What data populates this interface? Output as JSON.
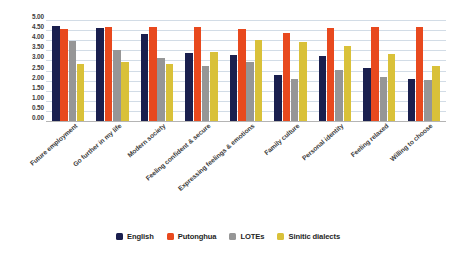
{
  "chart_data": {
    "type": "bar",
    "title": "",
    "subtitle": "",
    "xlabel": "",
    "ylabel": "",
    "ylim": [
      0,
      5
    ],
    "ytick_step": 0.5,
    "ytick_labels": [
      "0.00",
      "0.50",
      "1.00",
      "1.50",
      "2.00",
      "2.50",
      "3.00",
      "3.50",
      "4.00",
      "4.50",
      "5.00"
    ],
    "grid": true,
    "legend_position": "bottom",
    "categories": [
      "Future employment",
      "Go further in my life",
      "Modern society",
      "Feeling confident & secure",
      "Expressing feelings & emotions",
      "Family culture",
      "Personal identity",
      "Feeling relaxed",
      "Willing to choose"
    ],
    "series": [
      {
        "name": "English",
        "color": "#1a1f4e",
        "values": [
          4.7,
          4.62,
          4.32,
          3.35,
          3.28,
          2.28,
          3.23,
          2.62,
          2.08
        ]
      },
      {
        "name": "Putonghua",
        "color": "#e8491e",
        "values": [
          4.55,
          4.65,
          4.63,
          4.65,
          4.55,
          4.38,
          4.58,
          4.65,
          4.63
        ]
      },
      {
        "name": "LOTEs",
        "color": "#969696",
        "values": [
          3.95,
          3.5,
          3.13,
          2.73,
          2.92,
          2.1,
          2.55,
          2.2,
          2.05
        ]
      },
      {
        "name": "Sinitic dialects",
        "color": "#d9c139",
        "values": [
          2.8,
          2.93,
          2.83,
          3.4,
          4.0,
          3.92,
          3.7,
          3.32,
          2.72
        ]
      }
    ]
  }
}
